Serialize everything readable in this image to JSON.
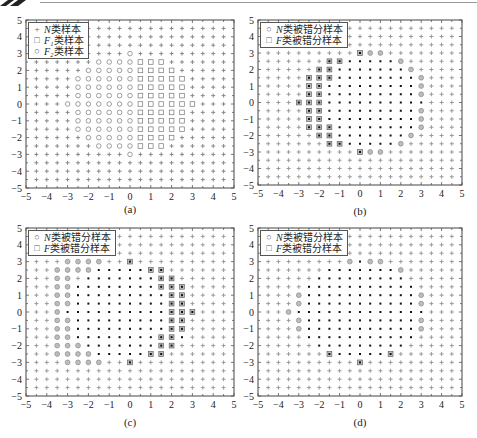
{
  "figure": {
    "captions": [
      "(a)",
      "(b)",
      "(c)",
      "(d)"
    ]
  },
  "panels": [
    {
      "id": "a",
      "caption": "(a)",
      "legend": [
        {
          "symbol": "+",
          "italic": "N",
          "text": "类样本"
        },
        {
          "symbol": "□",
          "italic": "F₁",
          "text": "类样本"
        },
        {
          "symbol": "○",
          "italic": "F₂",
          "text": "类样本"
        }
      ]
    },
    {
      "id": "b",
      "caption": "(b)",
      "legend": [
        {
          "symbol": "○",
          "italic": "N",
          "text": "类被错分样本"
        },
        {
          "symbol": "□",
          "italic": "F",
          "text": "类被错分样本"
        }
      ]
    },
    {
      "id": "c",
      "caption": "(c)",
      "legend": [
        {
          "symbol": "○",
          "italic": "N",
          "text": "类被错分样本"
        },
        {
          "symbol": "□",
          "italic": "F",
          "text": "类被错分样本"
        }
      ]
    },
    {
      "id": "d",
      "caption": "(d)",
      "legend": [
        {
          "symbol": "○",
          "italic": "N",
          "text": "类被错分样本"
        },
        {
          "symbol": "□",
          "italic": "F",
          "text": "类被错分样本"
        }
      ]
    }
  ],
  "axes": {
    "xticks": [
      "-5",
      "-4",
      "-3",
      "-2",
      "-1",
      "0",
      "1",
      "2",
      "3",
      "4",
      "5"
    ],
    "yticks": [
      "5",
      "4",
      "3",
      "2",
      "1",
      "0",
      "-1",
      "-2",
      "-3",
      "-4",
      "-5"
    ]
  },
  "chart_data": [
    {
      "type": "scatter",
      "panel": "(a)",
      "title": "",
      "xlabel": "",
      "ylabel": "",
      "xlim": [
        -5,
        5
      ],
      "ylim": [
        -5,
        5
      ],
      "grid_step": 0.5,
      "grid_range": [
        -4.5,
        4.5
      ],
      "legend": [
        "N类样本",
        "F1类样本",
        "F2类样本"
      ],
      "legend_position": "upper left",
      "series": [
        {
          "name": "N类样本",
          "marker": "+",
          "rule": "grid points with x^2+y^2 > 9"
        },
        {
          "name": "F1类样本",
          "marker": "square",
          "rule": "grid points with x^2+y^2 <= 9 and x > 0"
        },
        {
          "name": "F2类样本",
          "marker": "circle",
          "rule": "grid points with x^2+y^2 <= 9 and x <= 0"
        }
      ]
    },
    {
      "type": "scatter",
      "panel": "(b)",
      "xlim": [
        -5,
        5
      ],
      "ylim": [
        -5,
        5
      ],
      "legend": [
        "N类被错分样本",
        "F类被错分样本"
      ],
      "legend_position": "upper left",
      "series": [
        {
          "name": "N类被错分样本",
          "marker": "circle",
          "points": [
            [
              0.5,
              3
            ],
            [
              1,
              3
            ],
            [
              2,
              2.5
            ],
            [
              2.5,
              2
            ],
            [
              3,
              1.5
            ],
            [
              3,
              1
            ],
            [
              3,
              0.5
            ],
            [
              3,
              -0.5
            ],
            [
              3,
              -1
            ],
            [
              3,
              -1.5
            ],
            [
              2.5,
              -2
            ],
            [
              2,
              -2.5
            ],
            [
              0.5,
              -3
            ],
            [
              1,
              -3
            ]
          ]
        },
        {
          "name": "F类被错分样本",
          "marker": "square",
          "points": [
            [
              0,
              3
            ],
            [
              -1.5,
              2.5
            ],
            [
              -1,
              2.5
            ],
            [
              -2,
              2
            ],
            [
              -1.5,
              2
            ],
            [
              -2.5,
              1.5
            ],
            [
              -2,
              1.5
            ],
            [
              -1.5,
              1.5
            ],
            [
              -2.5,
              1
            ],
            [
              -2,
              1
            ],
            [
              -2.5,
              0.5
            ],
            [
              -2,
              0.5
            ],
            [
              -3,
              0
            ],
            [
              -2.5,
              0
            ],
            [
              -2,
              0
            ],
            [
              -2.5,
              -0.5
            ],
            [
              -2,
              -0.5
            ],
            [
              -2.5,
              -1
            ],
            [
              -2,
              -1
            ],
            [
              -2.5,
              -1.5
            ],
            [
              -2,
              -1.5
            ],
            [
              -1.5,
              -1.5
            ],
            [
              -2,
              -2
            ],
            [
              -1.5,
              -2
            ],
            [
              -1.5,
              -2.5
            ],
            [
              -1,
              -2.5
            ],
            [
              0,
              -3
            ]
          ]
        }
      ]
    },
    {
      "type": "scatter",
      "panel": "(c)",
      "xlim": [
        -5,
        5
      ],
      "ylim": [
        -5,
        5
      ],
      "legend": [
        "N类被错分样本",
        "F类被错分样本"
      ],
      "legend_position": "upper left",
      "series": [
        {
          "name": "N类被错分样本",
          "marker": "circle",
          "points": [
            [
              -3,
              3
            ],
            [
              -2.5,
              3
            ],
            [
              -2,
              3
            ],
            [
              -1.5,
              3
            ],
            [
              -3.5,
              2.5
            ],
            [
              -3,
              2.5
            ],
            [
              -2.5,
              2.5
            ],
            [
              -2,
              2.5
            ],
            [
              -3.5,
              2
            ],
            [
              -3,
              2
            ],
            [
              -3.5,
              1.5
            ],
            [
              -3,
              1.5
            ],
            [
              -3.5,
              1
            ],
            [
              -3,
              1
            ],
            [
              -3.5,
              0.5
            ],
            [
              -3,
              0.5
            ],
            [
              -3.5,
              0
            ],
            [
              -3.5,
              -0.5
            ],
            [
              -3,
              -0.5
            ],
            [
              -3.5,
              -1
            ],
            [
              -3,
              -1
            ],
            [
              -3.5,
              -1.5
            ],
            [
              -3,
              -1.5
            ],
            [
              -3.5,
              -2
            ],
            [
              -3,
              -2
            ],
            [
              -2.5,
              -2
            ],
            [
              -3.5,
              -2.5
            ],
            [
              -3,
              -2.5
            ],
            [
              -2.5,
              -2.5
            ],
            [
              -2,
              -2.5
            ],
            [
              -3,
              -3
            ],
            [
              -2.5,
              -3
            ],
            [
              -2,
              -3
            ],
            [
              -1.5,
              -3
            ]
          ]
        },
        {
          "name": "F类被错分样本",
          "marker": "square",
          "points": [
            [
              0,
              3
            ],
            [
              1,
              2.5
            ],
            [
              1.5,
              2.5
            ],
            [
              1.5,
              2
            ],
            [
              2,
              2
            ],
            [
              1.5,
              1.5
            ],
            [
              2,
              1.5
            ],
            [
              2.5,
              1.5
            ],
            [
              2,
              1
            ],
            [
              2.5,
              1
            ],
            [
              2,
              0.5
            ],
            [
              2.5,
              0.5
            ],
            [
              2,
              0
            ],
            [
              2.5,
              0
            ],
            [
              3,
              0
            ],
            [
              2,
              -0.5
            ],
            [
              2.5,
              -0.5
            ],
            [
              2,
              -1
            ],
            [
              2.5,
              -1
            ],
            [
              1.5,
              -1.5
            ],
            [
              2,
              -1.5
            ],
            [
              1.5,
              -2
            ],
            [
              2,
              -2
            ],
            [
              1,
              -2.5
            ],
            [
              1.5,
              -2.5
            ],
            [
              0,
              -3
            ]
          ]
        }
      ]
    },
    {
      "type": "scatter",
      "panel": "(d)",
      "xlim": [
        -5,
        5
      ],
      "ylim": [
        -5,
        5
      ],
      "legend": [
        "N类被错分样本",
        "F类被错分样本"
      ],
      "legend_position": "upper left",
      "series": [
        {
          "name": "N类被错分样本",
          "marker": "circle",
          "points": [
            [
              -0.5,
              3
            ],
            [
              0.5,
              3
            ],
            [
              1,
              3
            ],
            [
              2,
              2.5
            ],
            [
              -3,
              1
            ],
            [
              3,
              1
            ],
            [
              -3,
              0.5
            ],
            [
              3,
              0.5
            ],
            [
              -3.5,
              0
            ],
            [
              -3,
              -0.5
            ],
            [
              3,
              -0.5
            ],
            [
              -3,
              -1
            ],
            [
              3,
              -1
            ]
          ]
        },
        {
          "name": "F类被错分样本",
          "marker": "square",
          "points": [
            [
              -1.5,
              -2.5
            ],
            [
              1.5,
              -2.5
            ],
            [
              0,
              -3
            ]
          ]
        }
      ]
    }
  ]
}
